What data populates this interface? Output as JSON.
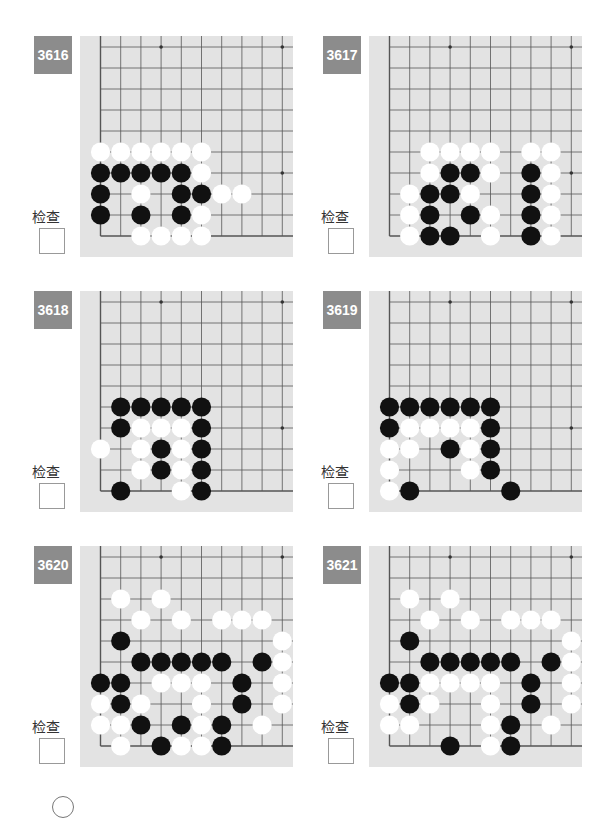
{
  "check_label": "检查",
  "colors": {
    "badge_bg": "#8c8c8c",
    "board_bg": "#e3e3e3",
    "grid_line": "#555555",
    "black_stone": "#111111",
    "white_stone": "#ffffff"
  },
  "board_layout": {
    "cols": 10,
    "rows": 10,
    "origin_x": 20.5,
    "origin_y": 11,
    "col_step": 20.2,
    "row_step": 21,
    "corner": "bottom-left",
    "star_points": [
      [
        3,
        0
      ],
      [
        9,
        0
      ],
      [
        3,
        6
      ],
      [
        9,
        6
      ]
    ]
  },
  "problems": [
    {
      "id": "3616",
      "black": [
        [
          0,
          6
        ],
        [
          1,
          6
        ],
        [
          2,
          6
        ],
        [
          3,
          6
        ],
        [
          4,
          6
        ],
        [
          0,
          7
        ],
        [
          4,
          7
        ],
        [
          5,
          7
        ],
        [
          0,
          8
        ],
        [
          2,
          8
        ],
        [
          4,
          8
        ]
      ],
      "white": [
        [
          0,
          5
        ],
        [
          1,
          5
        ],
        [
          2,
          5
        ],
        [
          3,
          5
        ],
        [
          4,
          5
        ],
        [
          5,
          5
        ],
        [
          5,
          6
        ],
        [
          2,
          7
        ],
        [
          6,
          7
        ],
        [
          7,
          7
        ],
        [
          5,
          8
        ],
        [
          2,
          9
        ],
        [
          3,
          9
        ],
        [
          4,
          9
        ],
        [
          5,
          9
        ]
      ]
    },
    {
      "id": "3617",
      "black": [
        [
          3,
          6
        ],
        [
          4,
          6
        ],
        [
          7,
          6
        ],
        [
          2,
          7
        ],
        [
          3,
          7
        ],
        [
          7,
          7
        ],
        [
          2,
          8
        ],
        [
          4,
          8
        ],
        [
          7,
          8
        ],
        [
          2,
          9
        ],
        [
          3,
          9
        ],
        [
          7,
          9
        ]
      ],
      "white": [
        [
          2,
          5
        ],
        [
          3,
          5
        ],
        [
          4,
          5
        ],
        [
          5,
          5
        ],
        [
          7,
          5
        ],
        [
          8,
          5
        ],
        [
          2,
          6
        ],
        [
          5,
          6
        ],
        [
          8,
          6
        ],
        [
          1,
          7
        ],
        [
          4,
          7
        ],
        [
          8,
          7
        ],
        [
          1,
          8
        ],
        [
          5,
          8
        ],
        [
          8,
          8
        ],
        [
          1,
          9
        ],
        [
          5,
          9
        ],
        [
          8,
          9
        ]
      ]
    },
    {
      "id": "3618",
      "black": [
        [
          1,
          5
        ],
        [
          2,
          5
        ],
        [
          3,
          5
        ],
        [
          4,
          5
        ],
        [
          5,
          5
        ],
        [
          1,
          6
        ],
        [
          5,
          6
        ],
        [
          3,
          7
        ],
        [
          5,
          7
        ],
        [
          3,
          8
        ],
        [
          5,
          8
        ],
        [
          1,
          9
        ],
        [
          5,
          9
        ]
      ],
      "white": [
        [
          2,
          6
        ],
        [
          3,
          6
        ],
        [
          4,
          6
        ],
        [
          0,
          7
        ],
        [
          2,
          7
        ],
        [
          4,
          7
        ],
        [
          2,
          8
        ],
        [
          4,
          8
        ],
        [
          4,
          9
        ]
      ]
    },
    {
      "id": "3619",
      "black": [
        [
          0,
          5
        ],
        [
          1,
          5
        ],
        [
          2,
          5
        ],
        [
          3,
          5
        ],
        [
          4,
          5
        ],
        [
          5,
          5
        ],
        [
          0,
          6
        ],
        [
          5,
          6
        ],
        [
          3,
          7
        ],
        [
          5,
          7
        ],
        [
          5,
          8
        ],
        [
          1,
          9
        ],
        [
          6,
          9
        ]
      ],
      "white": [
        [
          1,
          6
        ],
        [
          2,
          6
        ],
        [
          3,
          6
        ],
        [
          4,
          6
        ],
        [
          0,
          7
        ],
        [
          1,
          7
        ],
        [
          4,
          7
        ],
        [
          0,
          8
        ],
        [
          4,
          8
        ],
        [
          0,
          9
        ]
      ]
    },
    {
      "id": "3620",
      "black": [
        [
          1,
          4
        ],
        [
          2,
          5
        ],
        [
          3,
          5
        ],
        [
          4,
          5
        ],
        [
          5,
          5
        ],
        [
          6,
          5
        ],
        [
          8,
          5
        ],
        [
          0,
          6
        ],
        [
          1,
          6
        ],
        [
          7,
          6
        ],
        [
          1,
          7
        ],
        [
          7,
          7
        ],
        [
          2,
          8
        ],
        [
          4,
          8
        ],
        [
          6,
          8
        ],
        [
          3,
          9
        ],
        [
          6,
          9
        ]
      ],
      "white": [
        [
          1,
          2
        ],
        [
          3,
          2
        ],
        [
          2,
          3
        ],
        [
          4,
          3
        ],
        [
          6,
          3
        ],
        [
          7,
          3
        ],
        [
          8,
          3
        ],
        [
          9,
          4
        ],
        [
          9,
          5
        ],
        [
          3,
          6
        ],
        [
          4,
          6
        ],
        [
          5,
          6
        ],
        [
          9,
          6
        ],
        [
          0,
          7
        ],
        [
          2,
          7
        ],
        [
          5,
          7
        ],
        [
          9,
          7
        ],
        [
          0,
          8
        ],
        [
          1,
          8
        ],
        [
          5,
          8
        ],
        [
          8,
          8
        ],
        [
          1,
          9
        ],
        [
          4,
          9
        ],
        [
          5,
          9
        ]
      ]
    },
    {
      "id": "3621",
      "black": [
        [
          1,
          4
        ],
        [
          2,
          5
        ],
        [
          3,
          5
        ],
        [
          4,
          5
        ],
        [
          5,
          5
        ],
        [
          6,
          5
        ],
        [
          8,
          5
        ],
        [
          0,
          6
        ],
        [
          1,
          6
        ],
        [
          7,
          6
        ],
        [
          1,
          7
        ],
        [
          7,
          7
        ],
        [
          6,
          8
        ],
        [
          3,
          9
        ],
        [
          6,
          9
        ]
      ],
      "white": [
        [
          1,
          2
        ],
        [
          3,
          2
        ],
        [
          2,
          3
        ],
        [
          4,
          3
        ],
        [
          6,
          3
        ],
        [
          7,
          3
        ],
        [
          8,
          3
        ],
        [
          9,
          4
        ],
        [
          9,
          5
        ],
        [
          2,
          6
        ],
        [
          3,
          6
        ],
        [
          4,
          6
        ],
        [
          5,
          6
        ],
        [
          9,
          6
        ],
        [
          0,
          7
        ],
        [
          2,
          7
        ],
        [
          5,
          7
        ],
        [
          9,
          7
        ],
        [
          0,
          8
        ],
        [
          1,
          8
        ],
        [
          5,
          8
        ],
        [
          8,
          8
        ],
        [
          5,
          9
        ]
      ]
    }
  ]
}
